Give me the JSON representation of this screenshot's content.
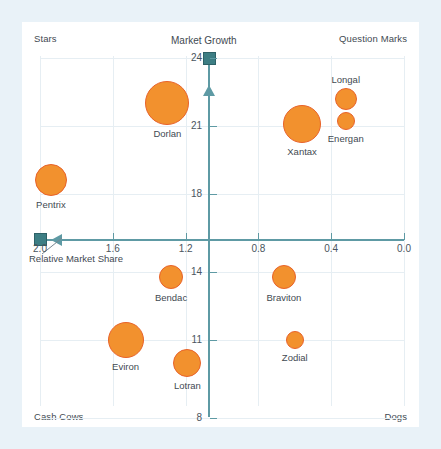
{
  "chart_data": {
    "type": "scatter",
    "xlabel": "Relative Market Share",
    "ylabel": "Market Growth",
    "xticks": [
      "2.0",
      "1.6",
      "1.2",
      "0.8",
      "0.4",
      "0.0"
    ],
    "xtick_values": [
      2.0,
      1.6,
      1.2,
      0.8,
      0.4,
      0.0
    ],
    "yticks": [
      "24",
      "21",
      "18",
      "14",
      "11",
      "8"
    ],
    "ytick_values": [
      24,
      21,
      18,
      14,
      11,
      8
    ],
    "xlim": [
      2.0,
      0.0
    ],
    "ylim": [
      8,
      24
    ],
    "x_axis_reversed": true,
    "grid": true,
    "legend": "none",
    "quadrants": [
      "Stars",
      "Question Marks",
      "Cash Cows",
      "Dogs"
    ],
    "points": [
      {
        "name": "Dorlan",
        "x": 1.3,
        "y": 22.0,
        "size": 44,
        "quadrant": "Stars"
      },
      {
        "name": "Pentrix",
        "x": 1.94,
        "y": 18.6,
        "size": 32,
        "quadrant": "Stars"
      },
      {
        "name": "Xantax",
        "x": 0.56,
        "y": 21.1,
        "size": 38,
        "quadrant": "Question Marks"
      },
      {
        "name": "Longal",
        "x": 0.32,
        "y": 22.2,
        "size": 22,
        "quadrant": "Question Marks"
      },
      {
        "name": "Energan",
        "x": 0.32,
        "y": 21.2,
        "size": 18,
        "quadrant": "Question Marks"
      },
      {
        "name": "Bendac",
        "x": 1.28,
        "y": 13.8,
        "size": 24,
        "quadrant": "Cash Cows"
      },
      {
        "name": "Eviron",
        "x": 1.53,
        "y": 11.0,
        "size": 36,
        "quadrant": "Cash Cows"
      },
      {
        "name": "Lotran",
        "x": 1.19,
        "y": 10.1,
        "size": 28,
        "quadrant": "Cash Cows"
      },
      {
        "name": "Braviton",
        "x": 0.66,
        "y": 13.8,
        "size": 24,
        "quadrant": "Dogs"
      },
      {
        "name": "Zodial",
        "x": 0.6,
        "y": 11.0,
        "size": 18,
        "quadrant": "Dogs"
      }
    ]
  },
  "chart": {
    "axis_titles": {
      "y": "Market Growth",
      "x": "Relative Market Share"
    },
    "corners": {
      "top_left": "Stars",
      "top_right": "Question Marks",
      "bottom_left": "Cash Cows",
      "bottom_right": "Dogs"
    },
    "colors": {
      "bubble_fill": "#f2912e",
      "bubble_stroke": "#e8622a",
      "axis": "#5e9aa4",
      "marker": "#3d7e84",
      "grid": "#e6eef3",
      "page_background": "#e9f2f8",
      "plot_background": "#ffffff",
      "text": "#3f4a52"
    }
  }
}
